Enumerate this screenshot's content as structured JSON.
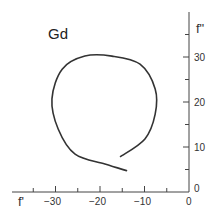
{
  "chart_data": {
    "type": "line",
    "title": "Gd",
    "xlabel": "f'",
    "ylabel": "f\"",
    "xlim": [
      -36,
      0
    ],
    "ylim": [
      0,
      37
    ],
    "x_ticks": [
      -30,
      -20,
      -10,
      0
    ],
    "y_ticks": [
      0,
      10,
      20,
      30
    ],
    "grid": false,
    "series": [
      {
        "name": "Gd",
        "x": [
          -13.9,
          -18.9,
          -25.6,
          -29.4,
          -30.8,
          -28.5,
          -23.4,
          -17.3,
          -11.0,
          -7.6,
          -7.6,
          -9.9,
          -15.5
        ],
        "y": [
          4.7,
          6.2,
          8.4,
          14.0,
          20.7,
          27.3,
          30.2,
          30.2,
          28.4,
          22.9,
          17.3,
          11.8,
          7.8
        ]
      }
    ]
  },
  "labels": {
    "title": "Gd",
    "xlabel": "f'",
    "ylabel": "f\"",
    "xt0": "−30",
    "xt1": "−20",
    "xt2": "−10",
    "xt3": "0",
    "yt0": "0",
    "yt1": "10",
    "yt2": "20",
    "yt3": "30"
  }
}
